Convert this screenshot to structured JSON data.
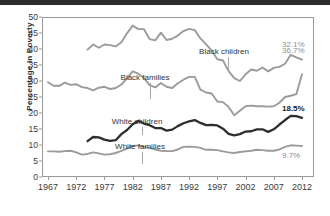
{
  "chart_data": {
    "type": "line",
    "title": "",
    "xlabel": "",
    "ylabel": "Percentage in Poverty",
    "xlim": [
      1967,
      2012
    ],
    "ylim": [
      0,
      50
    ],
    "grid": false,
    "legend_position": "inline-annotations",
    "xticks": [
      "1967",
      "1972",
      "1977",
      "1982",
      "1987",
      "1992",
      "1997",
      "2002",
      "2007",
      "2012"
    ],
    "yticks": [
      "0",
      "5",
      "10",
      "15",
      "20",
      "25",
      "30",
      "35",
      "40",
      "45",
      "50"
    ],
    "series": [
      {
        "name": "Black children",
        "color": "#9b9b9b",
        "end_label": "36.7%",
        "x": [
          1974,
          1975,
          1976,
          1977,
          1978,
          1979,
          1980,
          1981,
          1982,
          1983,
          1984,
          1985,
          1986,
          1987,
          1988,
          1989,
          1990,
          1991,
          1992,
          1993,
          1994,
          1995,
          1996,
          1997,
          1998,
          1999,
          2000,
          2001,
          2002,
          2003,
          2004,
          2005,
          2006,
          2007,
          2008,
          2009,
          2010,
          2011,
          2012
        ],
        "values": [
          39.8,
          41.4,
          40.4,
          41.4,
          41.2,
          40.8,
          42.1,
          44.9,
          47.3,
          46.2,
          46.2,
          43.1,
          42.7,
          45.1,
          42.8,
          43.2,
          44.2,
          45.6,
          46.3,
          45.9,
          43.3,
          41.5,
          39.5,
          36.8,
          36.4,
          33.1,
          30.9,
          30.0,
          32.1,
          33.6,
          33.2,
          34.2,
          33.0,
          34.1,
          34.4,
          35.4,
          38.2,
          37.4,
          36.7
        ]
      },
      {
        "name": "Black families",
        "color": "#9b9b9b",
        "end_label": "32.1%",
        "x": [
          1967,
          1968,
          1969,
          1970,
          1971,
          1972,
          1973,
          1974,
          1975,
          1976,
          1977,
          1978,
          1979,
          1980,
          1981,
          1982,
          1983,
          1984,
          1985,
          1986,
          1987,
          1988,
          1989,
          1990,
          1991,
          1992,
          1993,
          1994,
          1995,
          1996,
          1997,
          1998,
          1999,
          2000,
          2001,
          2002,
          2003,
          2004,
          2005,
          2006,
          2007,
          2008,
          2009,
          2010,
          2011,
          2012
        ],
        "values": [
          29.6,
          28.5,
          28.5,
          29.5,
          28.8,
          29.0,
          28.1,
          27.8,
          27.1,
          27.9,
          28.2,
          27.5,
          27.8,
          28.9,
          30.8,
          33.0,
          32.3,
          30.9,
          28.7,
          28.0,
          29.4,
          28.2,
          27.8,
          29.3,
          30.4,
          31.3,
          31.3,
          27.3,
          26.4,
          26.1,
          23.6,
          23.4,
          21.9,
          19.3,
          20.7,
          22.1,
          22.3,
          22.1,
          22.1,
          22.0,
          22.1,
          23.2,
          25.0,
          25.4,
          25.9,
          32.1
        ]
      },
      {
        "name": "White children",
        "color": "#2e2e2e",
        "end_label": "18.5%",
        "x": [
          1974,
          1975,
          1976,
          1977,
          1978,
          1979,
          1980,
          1981,
          1982,
          1983,
          1984,
          1985,
          1986,
          1987,
          1988,
          1989,
          1990,
          1991,
          1992,
          1993,
          1994,
          1995,
          1996,
          1997,
          1998,
          1999,
          2000,
          2001,
          2002,
          2003,
          2004,
          2005,
          2006,
          2007,
          2008,
          2009,
          2010,
          2011,
          2012
        ],
        "values": [
          11.2,
          12.5,
          12.4,
          11.7,
          11.3,
          11.5,
          13.4,
          14.7,
          16.5,
          17.5,
          16.7,
          16.2,
          15.3,
          15.3,
          14.5,
          14.8,
          15.9,
          16.8,
          17.4,
          17.8,
          16.9,
          16.2,
          16.3,
          16.1,
          15.1,
          13.5,
          13.0,
          13.4,
          14.2,
          14.3,
          14.9,
          14.9,
          14.1,
          14.9,
          16.4,
          17.8,
          19.1,
          19.0,
          18.5
        ]
      },
      {
        "name": "White families",
        "color": "#9b9b9b",
        "end_label": "9.7%",
        "x": [
          1967,
          1968,
          1969,
          1970,
          1971,
          1972,
          1973,
          1974,
          1975,
          1976,
          1977,
          1978,
          1979,
          1980,
          1981,
          1982,
          1983,
          1984,
          1985,
          1986,
          1987,
          1988,
          1989,
          1990,
          1991,
          1992,
          1993,
          1994,
          1995,
          1996,
          1997,
          1998,
          1999,
          2000,
          2001,
          2002,
          2003,
          2004,
          2005,
          2006,
          2007,
          2008,
          2009,
          2010,
          2011,
          2012
        ],
        "values": [
          8.0,
          8.0,
          7.9,
          8.1,
          8.2,
          7.7,
          7.0,
          7.2,
          7.7,
          7.4,
          7.0,
          7.1,
          7.5,
          8.2,
          8.9,
          9.7,
          9.9,
          9.4,
          9.1,
          8.6,
          8.2,
          8.1,
          8.1,
          8.6,
          9.4,
          9.5,
          9.4,
          9.1,
          8.5,
          8.5,
          8.4,
          8.0,
          7.7,
          7.5,
          7.8,
          8.0,
          8.2,
          8.5,
          8.4,
          8.2,
          8.2,
          8.6,
          9.4,
          9.9,
          9.8,
          9.7
        ]
      }
    ],
    "annotations": [
      {
        "text": "Black children",
        "series": "Black children"
      },
      {
        "text": "Black families",
        "series": "Black families"
      },
      {
        "text": "White children",
        "series": "White children"
      },
      {
        "text": "White families",
        "series": "White families"
      }
    ]
  }
}
